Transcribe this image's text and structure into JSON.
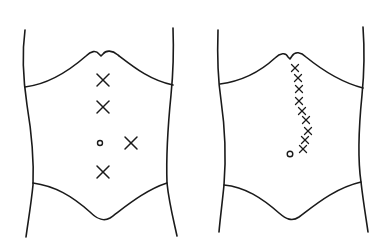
{
  "diagram": {
    "type": "anatomical line drawing",
    "background": "#ffffff",
    "stroke_color": "#1a1a1a",
    "panels": [
      {
        "id": "left",
        "label": "",
        "subject": "abdomen outline (torso front view)",
        "umbilicus": {
          "x": 100,
          "y": 143,
          "r": 2.5
        },
        "marks": [
          {
            "x": 103,
            "y": 80,
            "size": 6
          },
          {
            "x": 103,
            "y": 107,
            "size": 6
          },
          {
            "x": 131,
            "y": 143,
            "size": 6
          },
          {
            "x": 103,
            "y": 172,
            "size": 6
          }
        ]
      },
      {
        "id": "right",
        "label": "",
        "subject": "abdomen outline (torso front view)",
        "umbilicus": {
          "x": 290,
          "y": 154,
          "r": 2.8
        },
        "marks": [
          {
            "x": 295,
            "y": 68,
            "size": 3.5
          },
          {
            "x": 298,
            "y": 78,
            "size": 3.5
          },
          {
            "x": 299,
            "y": 89,
            "size": 3.5
          },
          {
            "x": 299,
            "y": 101,
            "size": 3.5
          },
          {
            "x": 302,
            "y": 111,
            "size": 3.5
          },
          {
            "x": 306,
            "y": 120,
            "size": 3.5
          },
          {
            "x": 308,
            "y": 131,
            "size": 3.5
          },
          {
            "x": 305,
            "y": 140,
            "size": 3.5
          },
          {
            "x": 303,
            "y": 149,
            "size": 3.5
          }
        ]
      }
    ],
    "legend": {
      "x_mark": "marked point",
      "circle": "umbilicus"
    }
  }
}
